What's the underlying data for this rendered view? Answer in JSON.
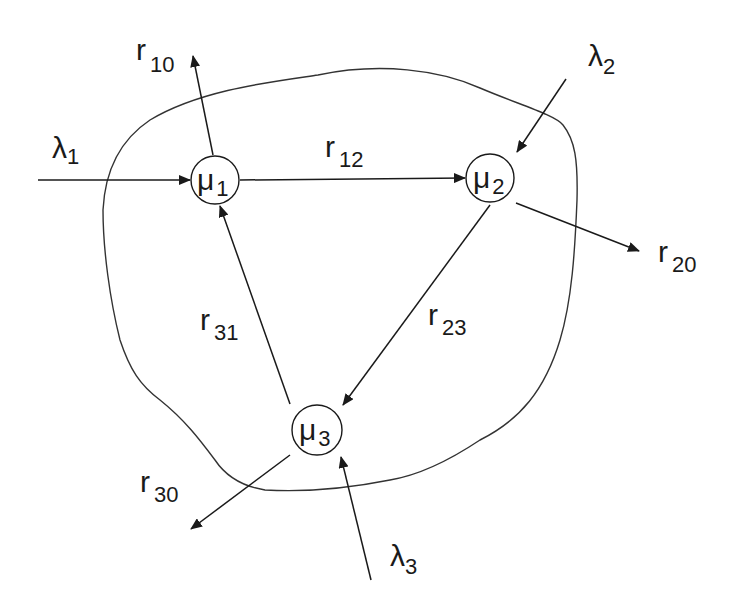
{
  "diagram": {
    "type": "queueing-network",
    "nodes": [
      {
        "id": "mu1",
        "symbol": "μ",
        "sub": "1"
      },
      {
        "id": "mu2",
        "symbol": "μ",
        "sub": "2"
      },
      {
        "id": "mu3",
        "symbol": "μ",
        "sub": "3"
      }
    ],
    "arrivals": [
      {
        "id": "lambda1",
        "symbol": "λ",
        "sub": "1",
        "to": "mu1"
      },
      {
        "id": "lambda2",
        "symbol": "λ",
        "sub": "2",
        "to": "mu2"
      },
      {
        "id": "lambda3",
        "symbol": "λ",
        "sub": "3",
        "to": "mu3"
      }
    ],
    "routes": [
      {
        "id": "r12",
        "symbol": "r",
        "sub": "12",
        "from": "mu1",
        "to": "mu2"
      },
      {
        "id": "r23",
        "symbol": "r",
        "sub": "23",
        "from": "mu2",
        "to": "mu3"
      },
      {
        "id": "r31",
        "symbol": "r",
        "sub": "31",
        "from": "mu3",
        "to": "mu1"
      }
    ],
    "departures": [
      {
        "id": "r10",
        "symbol": "r",
        "sub": "10",
        "from": "mu1"
      },
      {
        "id": "r20",
        "symbol": "r",
        "sub": "20",
        "from": "mu2"
      },
      {
        "id": "r30",
        "symbol": "r",
        "sub": "30",
        "from": "mu3"
      }
    ]
  }
}
